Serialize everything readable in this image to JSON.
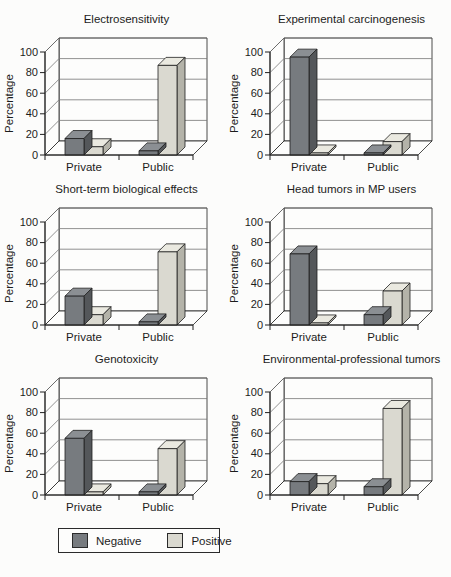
{
  "colors": {
    "negative_front": "#777b7f",
    "negative_top": "#8b8f93",
    "negative_side": "#54575a",
    "positive_front": "#dad9d0",
    "positive_top": "#eae9e0",
    "positive_side": "#b4b3a9",
    "outline": "#1f1f1f",
    "grid": "#757575",
    "wall": "#fdfdfc",
    "text": "#1c1c1c"
  },
  "legend": {
    "items": [
      {
        "label": "Negative",
        "swatch": "negative_front"
      },
      {
        "label": "Positive",
        "swatch": "positive_front"
      }
    ]
  },
  "chart_data": [
    {
      "type": "bar",
      "title": "Electrosensitivity",
      "ylabel": "Percentage",
      "categories": [
        "Private",
        "Public"
      ],
      "yticks": [
        0,
        20,
        40,
        60,
        80,
        100
      ],
      "ylim": [
        0,
        100
      ],
      "legend_position": "bottom",
      "grid": true,
      "series": [
        {
          "name": "Negative",
          "values": [
            16,
            4
          ]
        },
        {
          "name": "Positive",
          "values": [
            8,
            87
          ]
        }
      ]
    },
    {
      "type": "bar",
      "title": "Experimental carcinogenesis",
      "ylabel": "Percentage",
      "categories": [
        "Private",
        "Public"
      ],
      "yticks": [
        0,
        20,
        40,
        60,
        80,
        100
      ],
      "ylim": [
        0,
        100
      ],
      "legend_position": "bottom",
      "grid": true,
      "series": [
        {
          "name": "Negative",
          "values": [
            95,
            2
          ]
        },
        {
          "name": "Positive",
          "values": [
            2,
            13
          ]
        }
      ]
    },
    {
      "type": "bar",
      "title": "Short-term biological effects",
      "ylabel": "Percentage",
      "categories": [
        "Private",
        "Public"
      ],
      "yticks": [
        0,
        20,
        40,
        60,
        80,
        100
      ],
      "ylim": [
        0,
        100
      ],
      "legend_position": "bottom",
      "grid": true,
      "series": [
        {
          "name": "Negative",
          "values": [
            28,
            3
          ]
        },
        {
          "name": "Positive",
          "values": [
            10,
            71
          ]
        }
      ]
    },
    {
      "type": "bar",
      "title": "Head tumors in MP users",
      "ylabel": "Percentage",
      "categories": [
        "Private",
        "Public"
      ],
      "yticks": [
        0,
        20,
        40,
        60,
        80,
        100
      ],
      "ylim": [
        0,
        100
      ],
      "legend_position": "bottom",
      "grid": true,
      "series": [
        {
          "name": "Negative",
          "values": [
            69,
            10
          ]
        },
        {
          "name": "Positive",
          "values": [
            2,
            33
          ]
        }
      ]
    },
    {
      "type": "bar",
      "title": "Genotoxicity",
      "ylabel": "Percentage",
      "categories": [
        "Private",
        "Public"
      ],
      "yticks": [
        0,
        20,
        40,
        60,
        80,
        100
      ],
      "ylim": [
        0,
        100
      ],
      "legend_position": "bottom",
      "grid": true,
      "series": [
        {
          "name": "Negative",
          "values": [
            55,
            3
          ]
        },
        {
          "name": "Positive",
          "values": [
            3,
            45
          ]
        }
      ]
    },
    {
      "type": "bar",
      "title": "Environmental-professional tumors",
      "ylabel": "Percentage",
      "categories": [
        "Private",
        "Public"
      ],
      "yticks": [
        0,
        20,
        40,
        60,
        80,
        100
      ],
      "ylim": [
        0,
        100
      ],
      "legend_position": "bottom",
      "grid": true,
      "series": [
        {
          "name": "Negative",
          "values": [
            13,
            8
          ]
        },
        {
          "name": "Positive",
          "values": [
            11,
            84
          ]
        }
      ]
    }
  ]
}
